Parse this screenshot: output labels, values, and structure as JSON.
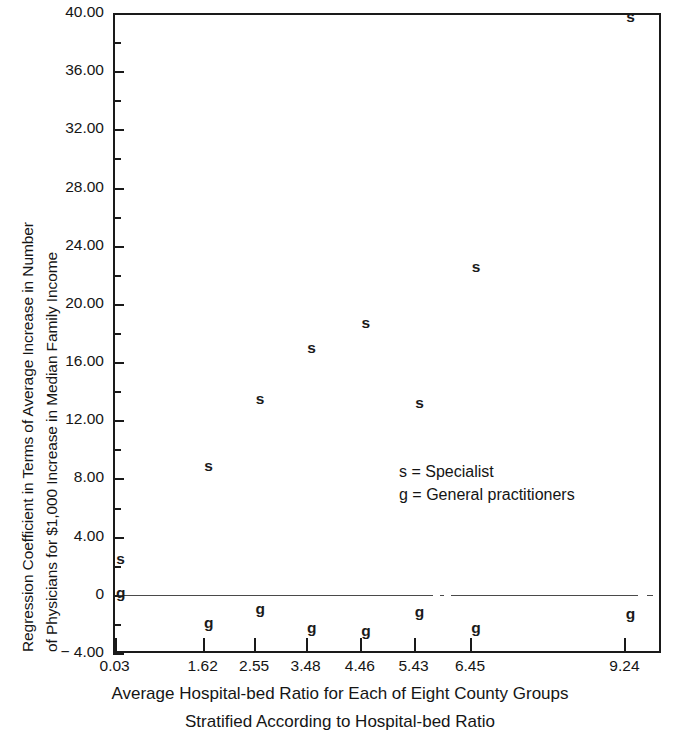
{
  "chart_data": {
    "type": "scatter",
    "title": "",
    "xlabel": "Average Hospital-bed Ratio for Each of Eight County Groups Stratified According to Hospital-bed Ratio",
    "ylabel": "Regression Coefficient in Terms of Average Increase in Number of Physicians for $1,000 Increase in Median Family Income",
    "xlim": [
      0,
      9.9
    ],
    "ylim": [
      -4,
      40
    ],
    "grid": false,
    "legend_position": "center-right-inside",
    "categories": [
      "0.03",
      "1.62",
      "2.55",
      "3.48",
      "4.46",
      "5.43",
      "6.45",
      "9.24"
    ],
    "x": [
      0.03,
      1.62,
      2.55,
      3.48,
      4.46,
      5.43,
      6.45,
      9.24
    ],
    "series": [
      {
        "name": "s",
        "label": "Specialist",
        "marker": "s",
        "values": [
          1.7,
          8.1,
          12.7,
          16.2,
          17.9,
          12.4,
          21.8,
          39.0
        ]
      },
      {
        "name": "g",
        "label": "General practitioners",
        "marker": "g",
        "values": [
          0.0,
          -0.8,
          -0.4,
          -1.0,
          -1.1,
          -0.5,
          -1.0,
          -0.5
        ]
      }
    ],
    "y_major_ticks": [
      -4,
      0,
      4,
      8,
      12,
      16,
      20,
      24,
      28,
      32,
      36,
      40
    ],
    "y_major_tick_labels": [
      "− 4.00",
      "0",
      "4.00",
      "8.00",
      "12.00",
      "16.00",
      "20.00",
      "24.00",
      "28.00",
      "32.00",
      "36.00",
      "40.00"
    ],
    "y_minor_ticks": [
      -2,
      2,
      6,
      10,
      14,
      18,
      22,
      26,
      30,
      34,
      38
    ],
    "x_tick_labels": [
      "0.03",
      "1.62",
      "2.55",
      "3.48",
      "4.46",
      "5.43",
      "6.45",
      "9.24"
    ]
  },
  "axis": {
    "y_title_line1": "Regression Coefficient in Terms of Average Increase in Number",
    "y_title_line2": "of Physicians for $1,000 Increase in Median Family Income",
    "x_title_line1": "Average Hospital-bed Ratio for Each of Eight County Groups",
    "x_title_line2": "Stratified According to Hospital-bed Ratio"
  },
  "legend": {
    "line1": "s = Specialist",
    "line2": "g = General practitioners"
  },
  "colors": {
    "axis": "#1a1a1a",
    "text": "#151515",
    "marker": "#1a1a1a",
    "zero_line": "#4a4a4a",
    "background": "#ffffff"
  }
}
